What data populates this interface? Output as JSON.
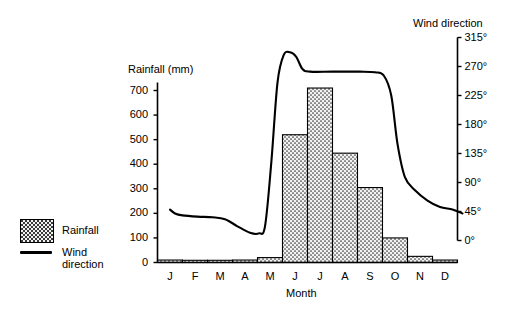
{
  "chart_data": {
    "type": "bar",
    "title": "",
    "xlabel": "Month",
    "categories": [
      "J",
      "F",
      "M",
      "A",
      "M",
      "J",
      "J",
      "A",
      "S",
      "O",
      "N",
      "D"
    ],
    "month_names": [
      "January",
      "February",
      "March",
      "April",
      "May",
      "June",
      "July",
      "August",
      "September",
      "October",
      "November",
      "December"
    ],
    "grid": false,
    "legend_position": "left-outside",
    "series": [
      {
        "name": "Rainfall",
        "type": "bar",
        "axis": "left",
        "unit": "mm",
        "values": [
          10,
          2,
          2,
          10,
          20,
          520,
          710,
          445,
          305,
          100,
          25,
          10
        ]
      },
      {
        "name": "Wind direction",
        "type": "line",
        "axis": "right",
        "unit": "degrees",
        "values": [
          45,
          38,
          37,
          12,
          290,
          262,
          262,
          262,
          258,
          78,
          52,
          42
        ],
        "path_points": [
          [
            0.0,
            48
          ],
          [
            0.2,
            42
          ],
          [
            0.5,
            39
          ],
          [
            1.1,
            37
          ],
          [
            1.7,
            36
          ],
          [
            2.2,
            33
          ],
          [
            2.7,
            22
          ],
          [
            3.2,
            12
          ],
          [
            3.55,
            11
          ],
          [
            3.8,
            22
          ],
          [
            4.05,
            120
          ],
          [
            4.3,
            245
          ],
          [
            4.55,
            288
          ],
          [
            4.8,
            292
          ],
          [
            5.05,
            285
          ],
          [
            5.3,
            266
          ],
          [
            5.6,
            262
          ],
          [
            6.5,
            262
          ],
          [
            7.6,
            262
          ],
          [
            8.2,
            261
          ],
          [
            8.55,
            256
          ],
          [
            8.85,
            225
          ],
          [
            9.1,
            150
          ],
          [
            9.4,
            98
          ],
          [
            9.8,
            78
          ],
          [
            10.3,
            62
          ],
          [
            10.8,
            52
          ],
          [
            11.3,
            48
          ],
          [
            11.7,
            42
          ]
        ]
      }
    ]
  },
  "axes": {
    "left": {
      "title": "Rainfall (mm)",
      "ticks": [
        "700",
        "600",
        "500",
        "400",
        "300",
        "200",
        "100",
        "0"
      ],
      "tick_values": [
        700,
        600,
        500,
        400,
        300,
        200,
        100,
        0
      ],
      "min": 0,
      "max": 740
    },
    "right": {
      "title": "Wind direction",
      "ticks": [
        "315°",
        "270°",
        "225°",
        "180°",
        "135°",
        "90°",
        "45°",
        "0°"
      ],
      "tick_values": [
        315,
        270,
        225,
        180,
        135,
        90,
        45,
        0
      ],
      "min": 0,
      "max": 315
    },
    "bottom": {
      "title": "Month",
      "ticks": [
        "J",
        "F",
        "M",
        "A",
        "M",
        "J",
        "J",
        "A",
        "S",
        "O",
        "N",
        "D"
      ]
    }
  },
  "legend": {
    "items": [
      {
        "label": "Rainfall",
        "marker": "dotted-square-swatch"
      },
      {
        "label": "Wind direction",
        "label_line1": "Wind",
        "label_line2": "direction",
        "marker": "solid-line"
      }
    ]
  },
  "colors": {
    "background": "#ffffff",
    "ink": "#000000",
    "bar_fill": "#f2f2f2",
    "bar_stipple": "#3a3a3a",
    "bar_stroke": "#000000",
    "line": "#000000"
  }
}
